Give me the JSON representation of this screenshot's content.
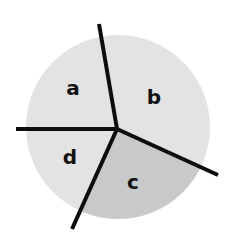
{
  "diagram": {
    "type": "divided-circle",
    "circle": {
      "cx": 118,
      "cy": 127,
      "r": 92
    },
    "center": {
      "x": 117,
      "y": 129
    },
    "colors": {
      "light_fill": "#e3e3e3",
      "dark_fill": "#c9c9c9",
      "line": "#0d0d0d",
      "label": "#111111"
    },
    "regions": [
      {
        "id": "a",
        "label": "a",
        "shade": "light",
        "label_x": 73,
        "label_y": 95
      },
      {
        "id": "b",
        "label": "b",
        "shade": "light",
        "label_x": 154,
        "label_y": 104
      },
      {
        "id": "c",
        "label": "c",
        "shade": "dark",
        "label_x": 133,
        "label_y": 189
      },
      {
        "id": "d",
        "label": "d",
        "shade": "light",
        "label_x": 70,
        "label_y": 164
      }
    ],
    "dividers": [
      {
        "id": "top",
        "x2": 99,
        "y2": 24
      },
      {
        "id": "left",
        "x2": 16,
        "y2": 129
      },
      {
        "id": "bottom-left",
        "x2": 72,
        "y2": 229
      },
      {
        "id": "right",
        "x2": 218,
        "y2": 175
      }
    ]
  }
}
